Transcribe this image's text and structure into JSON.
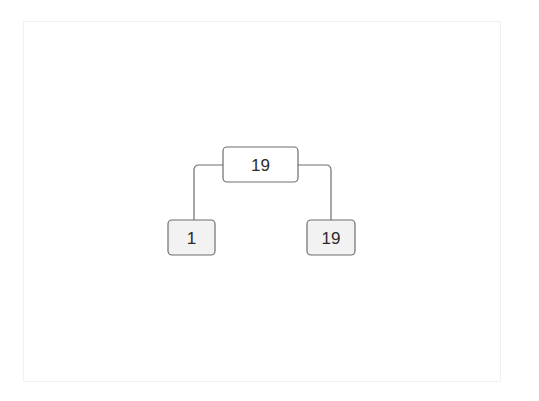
{
  "diagram": {
    "type": "binary-tree",
    "colors": {
      "internal_fill": "#ffffff",
      "leaf_fill": "#f2f2f2",
      "stroke": "#6e6e6e",
      "text": "#2b2b2b"
    },
    "root": {
      "id": "root",
      "label": "19",
      "kind": "internal",
      "children": [
        {
          "id": "left",
          "label": "1",
          "kind": "leaf"
        },
        {
          "id": "right",
          "label": "19",
          "kind": "leaf"
        }
      ]
    }
  }
}
